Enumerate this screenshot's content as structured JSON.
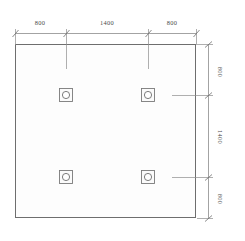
{
  "drawing": {
    "type": "structural-foundation-plan",
    "background_color": "#ffffff",
    "line_color": "#8c8c8c",
    "outline_color": "#6e6e6e",
    "symbol_color": "#7a7a7a",
    "text_color": "#4a4a4a",
    "slab_fill": "#fcfcfc",
    "units_implied": "mm"
  },
  "slab": {
    "name": "foundation-slab-outline",
    "x": 15,
    "y": 44,
    "width": 181,
    "height": 174
  },
  "top_dimensions": {
    "label": "top-dimension-chain",
    "segments": [
      {
        "value": "800",
        "x": 40,
        "y": 24
      },
      {
        "value": "1400",
        "x": 107,
        "y": 24
      },
      {
        "value": "800",
        "x": 172,
        "y": 24
      }
    ],
    "line_y": 33,
    "start_x": 15,
    "end_x": 196,
    "tick_xs": [
      15,
      66,
      148,
      196
    ]
  },
  "right_dimensions": {
    "label": "right-dimension-chain",
    "segments": [
      {
        "value": "800",
        "x": 216,
        "y": 73
      },
      {
        "value": "1400",
        "x": 216,
        "y": 137
      },
      {
        "value": "800",
        "x": 216,
        "y": 198
      }
    ],
    "line_x": 208,
    "start_y": 44,
    "end_y": 218,
    "tick_ys": [
      44,
      95,
      177,
      218
    ]
  },
  "columns": [
    {
      "name": "column-top-left",
      "cx": 66,
      "cy": 95
    },
    {
      "name": "column-top-right",
      "cx": 148,
      "cy": 95
    },
    {
      "name": "column-bottom-left",
      "cx": 66,
      "cy": 177
    },
    {
      "name": "column-bottom-right",
      "cx": 148,
      "cy": 177
    }
  ],
  "column_symbol": {
    "square_size": 13,
    "circle_radius": 3.6
  }
}
